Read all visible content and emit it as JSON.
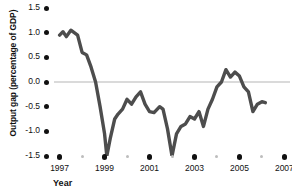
{
  "chart_data": {
    "type": "line",
    "title": "",
    "xlabel": "Year",
    "ylabel": "Output gap (percentage of GDP)",
    "xlim": [
      1996.75,
      2007.25
    ],
    "ylim": [
      -1.5,
      1.5
    ],
    "grid": false,
    "zero_line": true,
    "legend": "none",
    "line_color": "#4d4d4d",
    "zero_line_color": "#b5b5b5",
    "tick_dot_color": "#111111",
    "minor_tick_dot_color": "#bdbdbd",
    "y_ticks": [
      "1.5",
      "1.0",
      "0.5",
      "0.0",
      "-0.5",
      "-1.0",
      "-1.5"
    ],
    "y_tick_values": [
      1.5,
      1.0,
      0.5,
      0.0,
      -0.5,
      -1.0,
      -1.5
    ],
    "x_ticks_major": [
      "1997",
      "1999",
      "2001",
      "2003",
      "2005",
      "2007"
    ],
    "x_tick_major_values": [
      1997,
      1999,
      2001,
      2003,
      2005,
      2007
    ],
    "x_tick_minor_values": [
      1998,
      2000,
      2002,
      2004,
      2006
    ],
    "series": [
      {
        "name": "Output gap",
        "x": [
          1997.0,
          1997.15,
          1997.3,
          1997.5,
          1997.65,
          1997.8,
          1998.0,
          1998.2,
          1998.4,
          1998.6,
          1998.8,
          1999.0,
          1999.1,
          1999.25,
          1999.45,
          1999.6,
          1999.8,
          2000.0,
          2000.2,
          2000.4,
          2000.6,
          2000.8,
          2001.0,
          2001.2,
          2001.45,
          2001.6,
          2001.8,
          2002.0,
          2002.2,
          2002.4,
          2002.6,
          2002.8,
          2003.0,
          2003.2,
          2003.4,
          2003.6,
          2003.8,
          2004.0,
          2004.2,
          2004.4,
          2004.6,
          2004.8,
          2005.0,
          2005.2,
          2005.4,
          2005.6,
          2005.8,
          2006.0,
          2006.15
        ],
        "y": [
          0.95,
          1.02,
          0.92,
          1.05,
          1.0,
          0.95,
          0.6,
          0.55,
          0.3,
          0.0,
          -0.5,
          -1.05,
          -1.5,
          -1.15,
          -0.75,
          -0.65,
          -0.55,
          -0.35,
          -0.45,
          -0.3,
          -0.2,
          -0.45,
          -0.6,
          -0.62,
          -0.5,
          -0.55,
          -0.95,
          -1.5,
          -1.05,
          -0.9,
          -0.85,
          -0.7,
          -0.75,
          -0.6,
          -0.9,
          -0.55,
          -0.35,
          -0.1,
          0.0,
          0.25,
          0.1,
          0.2,
          0.12,
          -0.1,
          -0.2,
          -0.6,
          -0.45,
          -0.4,
          -0.42
        ]
      }
    ]
  }
}
